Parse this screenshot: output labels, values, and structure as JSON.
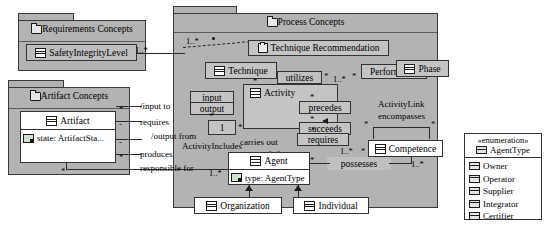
{
  "diagram": {
    "colors": {
      "package_fill": "#b3b3b3",
      "class_fill": "#c4c4c4",
      "white_fill": "#ffffff",
      "line": "#2b2b2b"
    }
  },
  "packages": [
    {
      "id": "requirements",
      "label": "Requirements Concepts",
      "icon": "folder-icon"
    },
    {
      "id": "artifact",
      "label": "Artifact Concepts",
      "icon": "folder-icon"
    },
    {
      "id": "process",
      "label": "Process Concepts",
      "icon": "folder-icon"
    }
  ],
  "classes": {
    "safety_integrity_level": {
      "name": "SafetyIntegrityLevel",
      "icon": "class-icon"
    },
    "artifact": {
      "name": "Artifact",
      "icon": "class-icon",
      "attribute": "state: ArtifactSta...",
      "attribute_icon": "attribute-icon"
    },
    "technique_recommendation": {
      "name": "Technique Recommendation",
      "icon": "note-icon"
    },
    "technique": {
      "name": "Technique",
      "icon": "class-icon"
    },
    "activity": {
      "name": "Activity",
      "icon": "class-icon"
    },
    "phase": {
      "name": "Phase",
      "icon": "class-icon"
    },
    "performed_in": {
      "name": "PerformedIn",
      "icon": "none"
    },
    "competence": {
      "name": "Competence",
      "icon": "class-icon"
    },
    "agent": {
      "name": "Agent",
      "icon": "class-icon",
      "attribute": "type: AgentType",
      "attribute_icon": "attribute-icon"
    },
    "organization": {
      "name": "Organization",
      "icon": "class-icon"
    },
    "individual": {
      "name": "Individual",
      "icon": "class-icon"
    }
  },
  "enumeration": {
    "stereotype": "«enumeration»",
    "name": "AgentType",
    "icon": "enumeration-icon",
    "literals": [
      "Owner",
      "Operator",
      "Supplier",
      "Integrator",
      "Certifier"
    ]
  },
  "associations": {
    "utilizes": "utilizes",
    "precedes": "precedes",
    "succeeds": "succeeds",
    "requires_competence": "requires",
    "possesses": "possesses",
    "carries_out": "carries out",
    "activity_includes": "ActivityIncludes",
    "activity_link": "ActivityLink",
    "encompasses": "encompasses",
    "input_to": "/input to",
    "requires_artifact": "requires",
    "output_from": "/output from",
    "produces": "produces",
    "responsible_for": "responsible for",
    "input": "input",
    "output": "output"
  },
  "multiplicities": {
    "sil_right": "1..*",
    "technique_left": "1..*",
    "utilizes_star": "*",
    "performed_one_a": "1..*",
    "performed_star": "*",
    "performed_in_right": "1",
    "phase_star": "*",
    "activity_star_top": "*",
    "precedes_star": "*",
    "succeeds_star": "*",
    "encompasses_star_l": "*",
    "encompasses_star_r": "*",
    "requires_star": "*",
    "requires_one": "1..*",
    "competence_right": "1..*",
    "possesses_star": "*",
    "agent_right_star": "*",
    "carries_one": "1..*",
    "includes_one": "1",
    "includes_star": "*",
    "agent_left": "1..*",
    "artifact_star_1": "*",
    "artifact_dash_1": "-",
    "artifact_star_2": "*",
    "artifact_dash_2": "-",
    "artifact_star_3": "*",
    "activity_in_star": "*"
  }
}
